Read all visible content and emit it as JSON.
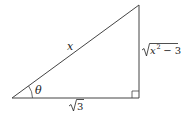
{
  "diagram": {
    "type": "right-triangle",
    "colors": {
      "stroke": "#444444",
      "text": "#222222",
      "background": "#ffffff"
    },
    "labels": {
      "hypotenuse": "x",
      "angle": "θ",
      "adjacent_radicand": "3",
      "opposite_base": "x",
      "opposite_exponent": "2",
      "opposite_rest": " − 3"
    },
    "vertices": {
      "angle_vertex": [
        12,
        98
      ],
      "right_angle_vertex": [
        139,
        98
      ],
      "top_vertex": [
        139,
        5
      ]
    }
  }
}
